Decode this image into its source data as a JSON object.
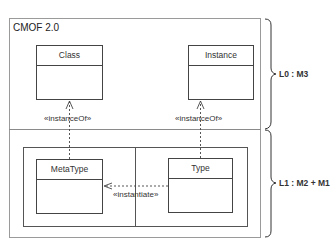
{
  "diagram": {
    "title": "CMOF 2.0",
    "layers": [
      {
        "label": "L0 : M3"
      },
      {
        "label": "L1 : M2 + M1"
      }
    ],
    "classes": {
      "class": {
        "name": "Class"
      },
      "instance": {
        "name": "Instance"
      },
      "metatype": {
        "name": "MetaType"
      },
      "type": {
        "name": "Type"
      }
    },
    "relations": [
      {
        "from": "MetaType",
        "to": "Class",
        "stereotype": "«instanceOf»"
      },
      {
        "from": "Type",
        "to": "Instance",
        "stereotype": "«instanceOf»"
      },
      {
        "from": "Type",
        "to": "MetaType",
        "stereotype": "«instantiate»"
      }
    ],
    "colors": {
      "line": "#444444",
      "frame": "#8a8a8a",
      "background": "#ffffff"
    }
  }
}
